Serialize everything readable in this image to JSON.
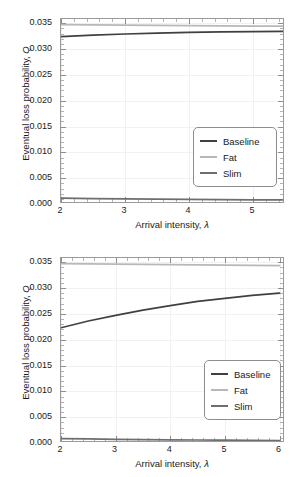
{
  "figure": {
    "background": "#ffffff",
    "panels": [
      "top",
      "bottom"
    ]
  },
  "axis_titles": {
    "x_prefix": "Arrival intensity, ",
    "x_symbol": "λ",
    "y_prefix": "Eventual loss probability, ",
    "y_symbol": "Q"
  },
  "legend": {
    "entries": [
      {
        "label": "Baseline",
        "color": "#404040"
      },
      {
        "label": "Fat",
        "color": "#b8b8b8"
      },
      {
        "label": "Slim",
        "color": "#6e6e6e"
      }
    ]
  },
  "chart_data": [
    {
      "type": "line",
      "panel": "top",
      "title": "",
      "xlabel": "Arrival intensity, λ",
      "ylabel": "Eventual loss probability, Q",
      "xlim": [
        2.0,
        5.5
      ],
      "ylim": [
        0.0,
        0.0358
      ],
      "xticks": [
        2,
        3,
        4,
        5
      ],
      "xtick_labels": [
        "2",
        "3",
        "4",
        "5"
      ],
      "yticks": [
        0.0,
        0.005,
        0.01,
        0.015,
        0.02,
        0.025,
        0.03,
        0.035
      ],
      "ytick_labels": [
        "0.000",
        "0.005",
        "0.010",
        "0.015",
        "0.020",
        "0.025",
        "0.030",
        "0.035"
      ],
      "grid": true,
      "legend_position": "lower right",
      "x": [
        2.0,
        2.5,
        3.0,
        3.5,
        4.0,
        4.5,
        5.0,
        5.5
      ],
      "series": [
        {
          "name": "Baseline",
          "color": "#404040",
          "values": [
            0.0324,
            0.03268,
            0.0329,
            0.03307,
            0.0332,
            0.0333,
            0.03337,
            0.03342
          ]
        },
        {
          "name": "Fat",
          "color": "#b8b8b8",
          "values": [
            0.03472,
            0.03467,
            0.03462,
            0.03457,
            0.03452,
            0.03448,
            0.03444,
            0.0344
          ]
        },
        {
          "name": "Slim",
          "color": "#6e6e6e",
          "values": [
            0.00112,
            0.00105,
            0.00099,
            0.00094,
            0.00089,
            0.00085,
            0.00081,
            0.00078
          ]
        }
      ]
    },
    {
      "type": "line",
      "panel": "bottom",
      "title": "",
      "xlabel": "Arrival intensity, λ",
      "ylabel": "Eventual loss probability, Q",
      "xlim": [
        2.0,
        6.1
      ],
      "ylim": [
        0.0,
        0.0358
      ],
      "xticks": [
        2,
        3,
        4,
        5,
        6
      ],
      "xtick_labels": [
        "2",
        "3",
        "4",
        "5",
        "6"
      ],
      "yticks": [
        0.0,
        0.005,
        0.01,
        0.015,
        0.02,
        0.025,
        0.03,
        0.035
      ],
      "ytick_labels": [
        "0.000",
        "0.005",
        "0.010",
        "0.015",
        "0.020",
        "0.025",
        "0.030",
        "0.035"
      ],
      "grid": true,
      "legend_position": "lower right",
      "x": [
        2.0,
        2.5,
        3.0,
        3.5,
        4.0,
        4.5,
        5.0,
        5.5,
        6.0
      ],
      "series": [
        {
          "name": "Baseline",
          "color": "#404040",
          "values": [
            0.0223,
            0.0236,
            0.0247,
            0.0257,
            0.0266,
            0.0274,
            0.028,
            0.02855,
            0.029
          ]
        },
        {
          "name": "Fat",
          "color": "#b8b8b8",
          "values": [
            0.03472,
            0.03466,
            0.0346,
            0.03455,
            0.0345,
            0.03446,
            0.03442,
            0.03438,
            0.03434
          ]
        },
        {
          "name": "Slim",
          "color": "#6e6e6e",
          "values": [
            0.00083,
            0.00078,
            0.00072,
            0.00067,
            0.00062,
            0.00058,
            0.00054,
            0.0005,
            0.00047
          ]
        }
      ]
    }
  ]
}
